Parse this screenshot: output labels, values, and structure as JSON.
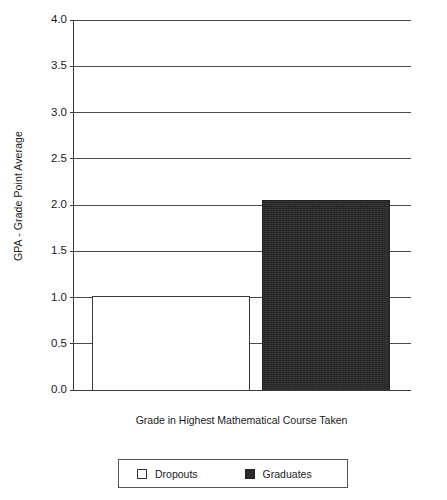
{
  "chart_data": {
    "type": "bar",
    "title": "",
    "xlabel": "Grade in Highest Mathematical Course Taken",
    "ylabel": "GPA - Grade Point Average",
    "categories": [
      "Grade in Highest Mathematical Course Taken"
    ],
    "ylim": [
      0.0,
      4.0
    ],
    "ytick_step": 0.5,
    "ytick_labels": [
      "4.0",
      "3.5",
      "3.0",
      "2.5",
      "2.0",
      "1.5",
      "1.0",
      "0.5",
      "0.0"
    ],
    "ytick_values": [
      4.0,
      3.5,
      3.0,
      2.5,
      2.0,
      1.5,
      1.0,
      0.5,
      0.0
    ],
    "grid": true,
    "grid_axis": "y",
    "legend_position": "bottom",
    "series": [
      {
        "name": "Dropouts",
        "values": [
          1.02
        ],
        "color": "#ffffff",
        "edge_color": "#3a3a3a",
        "swatch": "open"
      },
      {
        "name": "Graduates",
        "values": [
          2.05
        ],
        "color": "#2b2b2b",
        "edge_color": "#222222",
        "swatch": "solid"
      }
    ]
  },
  "figure": {
    "title_sliver": "",
    "background": "#ffffff",
    "axis_color": "#3a3a3a",
    "gridline_color": "#4a4a4a"
  },
  "axes": {
    "y_title": "GPA - Grade Point Average",
    "x_title": "Grade in Highest Mathematical Course Taken"
  },
  "legend": {
    "entries": [
      {
        "label": "Dropouts",
        "swatch": "open"
      },
      {
        "label": "Graduates",
        "swatch": "solid"
      }
    ]
  }
}
